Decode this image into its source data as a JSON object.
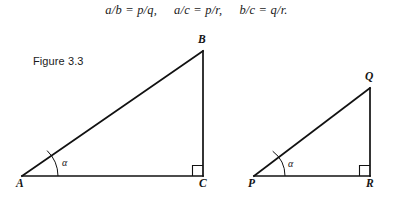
{
  "figure": {
    "caption": "Figure 3.3",
    "background_color": "#ffffff",
    "stroke_color": "#111111",
    "equation": {
      "part1": "a/b = p/q,",
      "part2": "a/c = p/r,",
      "part3": "b/c = q/r."
    },
    "triangles": [
      {
        "name": "triangle-abc",
        "vertices": [
          {
            "label": "A",
            "role": "angle-alpha-vertex",
            "x": 22,
            "y": 176
          },
          {
            "label": "C",
            "role": "right-angle-vertex",
            "x": 203,
            "y": 176
          },
          {
            "label": "B",
            "role": "apex",
            "x": 203,
            "y": 51
          }
        ],
        "angle_marker": {
          "label": "α",
          "at": "A"
        },
        "right_angle_at": "C",
        "sides": [
          "a",
          "b",
          "c"
        ]
      },
      {
        "name": "triangle-pqr",
        "vertices": [
          {
            "label": "P",
            "role": "angle-alpha-vertex",
            "x": 254,
            "y": 176
          },
          {
            "label": "R",
            "role": "right-angle-vertex",
            "x": 370,
            "y": 176
          },
          {
            "label": "Q",
            "role": "apex",
            "x": 370,
            "y": 88
          }
        ],
        "angle_marker": {
          "label": "α",
          "at": "P"
        },
        "right_angle_at": "R",
        "sides": [
          "p",
          "q",
          "r"
        ]
      }
    ]
  }
}
